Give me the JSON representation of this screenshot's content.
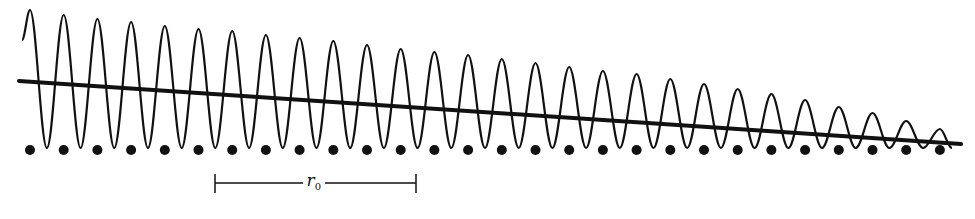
{
  "diagram": {
    "colors": {
      "ink": "#111111",
      "background": "#ffffff"
    },
    "wave": {
      "peak_x_start": 30,
      "period": 33.7,
      "cycles": 28,
      "trough_y": 148,
      "start_point": [
        22,
        40
      ],
      "end_point": [
        952,
        148
      ],
      "peak_y": [
        10,
        15,
        19,
        22,
        26,
        29,
        31,
        35,
        38,
        41,
        45,
        49,
        52,
        55,
        59,
        63,
        67,
        71,
        74,
        79,
        84,
        89,
        94,
        100,
        107,
        113,
        121,
        129
      ]
    },
    "line": {
      "x1": 19,
      "y1": 81,
      "x2": 961,
      "y2": 144
    },
    "dots": {
      "y": 150,
      "radius": 5,
      "count": 28,
      "x_start": 30,
      "spacing": 33.7
    },
    "scale_bar": {
      "label": "r",
      "subscript": "0",
      "x1": 215,
      "x2": 416,
      "y": 183
    }
  }
}
